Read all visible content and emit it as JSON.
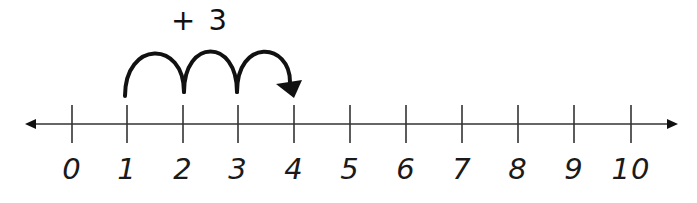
{
  "diagram": {
    "type": "number-line",
    "jump_label": "+ 3",
    "range": [
      0,
      10
    ],
    "ticks": [
      {
        "value": 0,
        "label": "0",
        "x": 72
      },
      {
        "value": 1,
        "label": "1",
        "x": 127
      },
      {
        "value": 2,
        "label": "2",
        "x": 183
      },
      {
        "value": 3,
        "label": "3",
        "x": 238
      },
      {
        "value": 4,
        "label": "4",
        "x": 294
      },
      {
        "value": 5,
        "label": "5",
        "x": 350
      },
      {
        "value": 6,
        "label": "6",
        "x": 406
      },
      {
        "value": 7,
        "label": "7",
        "x": 462
      },
      {
        "value": 8,
        "label": "8",
        "x": 518
      },
      {
        "value": 9,
        "label": "9",
        "x": 574
      },
      {
        "value": 10,
        "label": "10",
        "x": 631
      }
    ],
    "jumps": {
      "start": 1,
      "end": 4,
      "count": 3
    },
    "colors": {
      "line": "#333333",
      "arc": "#111111",
      "text": "#1a1a1a"
    }
  }
}
